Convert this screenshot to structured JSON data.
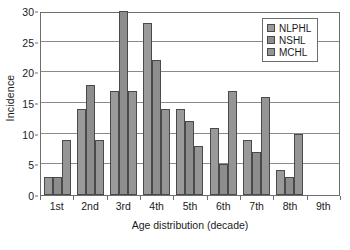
{
  "chart_data": {
    "type": "bar",
    "title": "",
    "xlabel": "Age distribution (decade)",
    "ylabel": "Incidence",
    "categories": [
      "1st",
      "2nd",
      "3rd",
      "4th",
      "5th",
      "6th",
      "7th",
      "8th",
      "9th"
    ],
    "series": [
      {
        "name": "NLPHL",
        "color": "#9a9a9a",
        "values": [
          3,
          14,
          17,
          28,
          14,
          11,
          9,
          4,
          0
        ]
      },
      {
        "name": "NSHL",
        "color": "#8d8d8d",
        "values": [
          3,
          18,
          30,
          22,
          12,
          5,
          7,
          3,
          0
        ]
      },
      {
        "name": "MCHL",
        "color": "#959595",
        "values": [
          9,
          9,
          17,
          14,
          8,
          17,
          16,
          10,
          0
        ]
      }
    ],
    "ylim": [
      0,
      30
    ],
    "yticks": [
      0,
      5,
      10,
      15,
      20,
      25,
      30
    ],
    "ytick_labels": [
      "0",
      "5",
      "10",
      "15",
      "20",
      "25",
      "30"
    ],
    "grid": true,
    "grid_axis": "y",
    "legend_position": "top-right",
    "bar_edge_color": "#4a4a4a",
    "axis_color": "#6d6d6d",
    "grid_color": "#8a8a8a"
  }
}
